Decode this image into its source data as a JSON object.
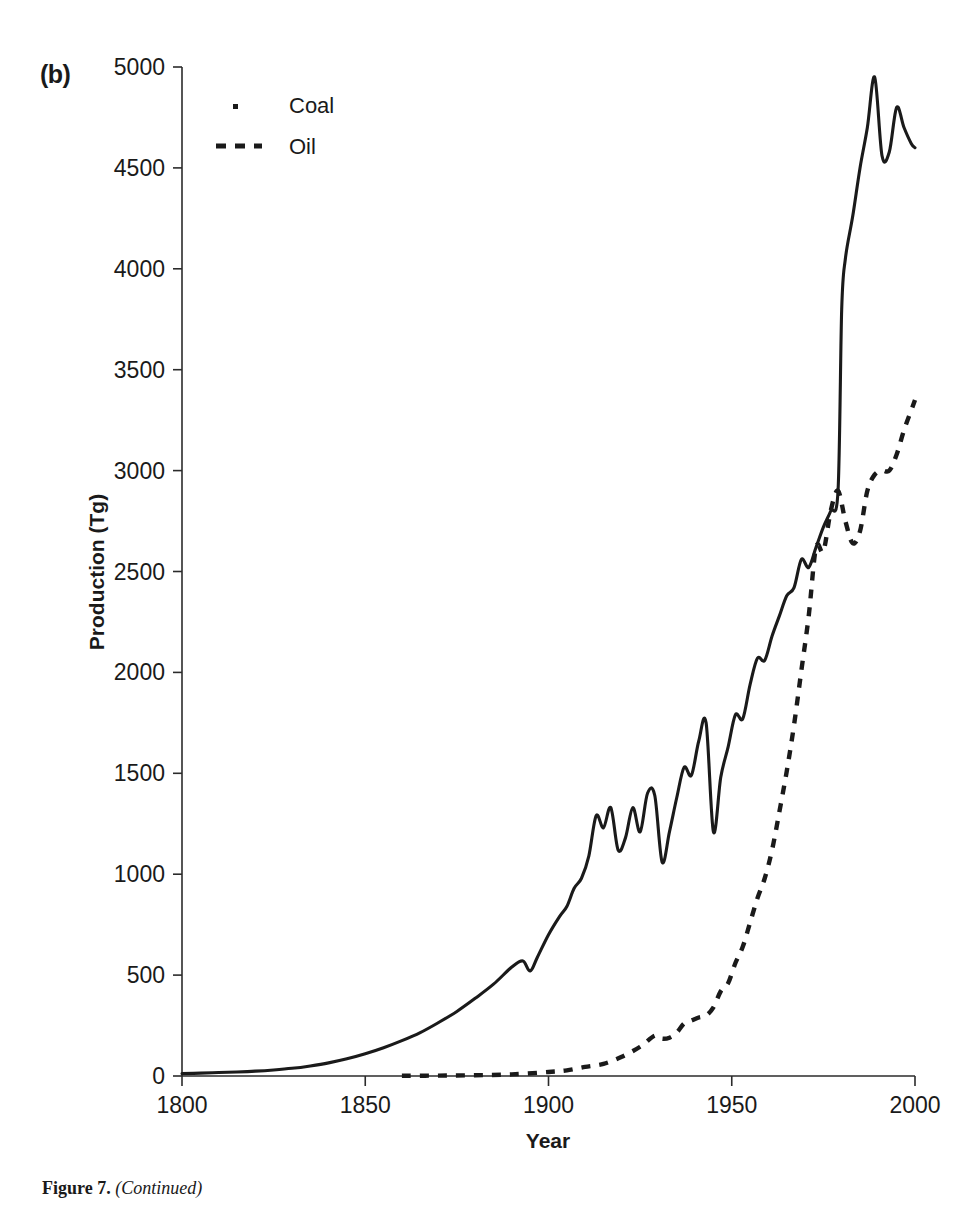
{
  "panel": {
    "label": "(b)"
  },
  "caption": {
    "figure_number": "Figure 7.",
    "continued": "(Continued)"
  },
  "chart_data": {
    "type": "line",
    "title": "",
    "xlabel": "Year",
    "ylabel": "Production (Tg)",
    "xlim": [
      1800,
      2000
    ],
    "ylim": [
      0,
      5000
    ],
    "xticks": [
      1800,
      1850,
      1900,
      1950,
      2000
    ],
    "yticks": [
      0,
      500,
      1000,
      1500,
      2000,
      2500,
      3000,
      3500,
      4000,
      4500,
      5000
    ],
    "grid": false,
    "legend_position": "top-left-inside",
    "legend": [
      "Coal",
      "Oil"
    ],
    "series": [
      {
        "name": "Coal",
        "style": "solid",
        "x": [
          1800,
          1805,
          1810,
          1815,
          1820,
          1825,
          1830,
          1835,
          1840,
          1845,
          1850,
          1855,
          1860,
          1865,
          1870,
          1875,
          1880,
          1885,
          1890,
          1893,
          1895,
          1897,
          1900,
          1903,
          1905,
          1907,
          1909,
          1911,
          1913,
          1915,
          1917,
          1919,
          1921,
          1923,
          1925,
          1927,
          1929,
          1931,
          1933,
          1935,
          1937,
          1939,
          1941,
          1943,
          1945,
          1947,
          1949,
          1951,
          1953,
          1955,
          1957,
          1959,
          1961,
          1963,
          1965,
          1967,
          1969,
          1971,
          1973,
          1975,
          1977,
          1979,
          1980,
          1981,
          1983,
          1985,
          1987,
          1989,
          1991,
          1993,
          1995,
          1997,
          1999,
          2000
        ],
        "y": [
          12,
          14,
          17,
          20,
          24,
          30,
          38,
          50,
          65,
          85,
          110,
          140,
          175,
          215,
          265,
          320,
          385,
          455,
          540,
          570,
          520,
          590,
          700,
          790,
          840,
          930,
          980,
          1090,
          1290,
          1230,
          1330,
          1120,
          1180,
          1330,
          1210,
          1400,
          1390,
          1060,
          1210,
          1380,
          1530,
          1490,
          1660,
          1750,
          1210,
          1480,
          1630,
          1790,
          1770,
          1940,
          2070,
          2060,
          2180,
          2280,
          2380,
          2420,
          2560,
          2520,
          2620,
          2720,
          2800,
          2900,
          3800,
          4050,
          4260,
          4500,
          4700,
          4950,
          4560,
          4580,
          4800,
          4700,
          4620,
          4600
        ]
      },
      {
        "name": "Oil",
        "style": "dashed",
        "x": [
          1860,
          1870,
          1880,
          1890,
          1900,
          1905,
          1910,
          1915,
          1920,
          1925,
          1929,
          1931,
          1933,
          1935,
          1937,
          1939,
          1941,
          1943,
          1945,
          1947,
          1949,
          1951,
          1953,
          1955,
          1957,
          1959,
          1961,
          1963,
          1965,
          1967,
          1969,
          1971,
          1973,
          1975,
          1977,
          1979,
          1981,
          1983,
          1985,
          1987,
          1989,
          1991,
          1993,
          1995,
          1997,
          1999,
          2000
        ],
        "y": [
          1,
          2,
          4,
          8,
          20,
          28,
          45,
          60,
          95,
          145,
          200,
          185,
          190,
          215,
          260,
          275,
          290,
          300,
          340,
          420,
          460,
          560,
          640,
          760,
          880,
          980,
          1120,
          1310,
          1510,
          1740,
          2010,
          2280,
          2620,
          2600,
          2800,
          2900,
          2750,
          2640,
          2700,
          2900,
          2980,
          3000,
          3000,
          3080,
          3200,
          3300,
          3350
        ]
      }
    ]
  },
  "axis": {
    "y_tick_labels": [
      "0",
      "500",
      "1000",
      "1500",
      "2000",
      "2500",
      "3000",
      "3500",
      "4000",
      "4500",
      "5000"
    ],
    "x_tick_labels": [
      "1800",
      "1850",
      "1900",
      "1950",
      "2000"
    ]
  }
}
